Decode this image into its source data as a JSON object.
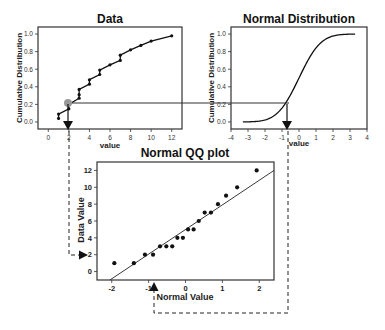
{
  "panels": {
    "data": {
      "title": "Data",
      "xlabel": "value",
      "ylabel": "Cumulative Distribution",
      "xticks": [
        "0",
        "2",
        "4",
        "6",
        "8",
        "10",
        "12"
      ],
      "yticks": [
        "0.0",
        "0.2",
        "0.4",
        "0.6",
        "0.8",
        "1.0"
      ]
    },
    "normal": {
      "title": "Normal Distribution",
      "xlabel": "value",
      "ylabel": "Cumulative Distribution",
      "xticks": [
        "-4",
        "-3",
        "-2",
        "-1",
        "0",
        "1",
        "2",
        "3",
        "4"
      ],
      "yticks": [
        "0.0",
        "0.2",
        "0.4",
        "0.6",
        "0.8",
        "1.0"
      ]
    },
    "qq": {
      "title": "Normal QQ plot",
      "xlabel": "Normal Value",
      "ylabel": "Data Value",
      "xticks": [
        "-2",
        "-1",
        "0",
        "1",
        "2"
      ],
      "yticks": [
        "0",
        "2",
        "4",
        "6",
        "8",
        "10",
        "12"
      ]
    }
  },
  "chart_data": [
    {
      "type": "line",
      "title": "Data",
      "xlabel": "value",
      "ylabel": "Cumulative Distribution",
      "xlim": [
        -1,
        13
      ],
      "ylim": [
        -0.08,
        1.08
      ],
      "description": "Empirical step CDF of the data",
      "x": [
        1,
        1,
        2,
        2,
        3,
        3,
        3,
        4,
        4,
        5,
        5,
        6,
        7,
        7,
        8,
        9,
        10,
        12
      ],
      "y": [
        0.04,
        0.09,
        0.15,
        0.2,
        0.27,
        0.31,
        0.37,
        0.43,
        0.48,
        0.54,
        0.59,
        0.65,
        0.7,
        0.76,
        0.82,
        0.87,
        0.92,
        0.98
      ],
      "highlight_point": {
        "x": 2,
        "y": 0.21
      }
    },
    {
      "type": "line",
      "title": "Normal Distribution",
      "xlabel": "value",
      "ylabel": "Cumulative Distribution",
      "xlim": [
        -4,
        4
      ],
      "ylim": [
        -0.08,
        1.08
      ],
      "description": "Standard normal CDF from -3.3 to 3.3",
      "highlight_point": {
        "x": -0.8,
        "y": 0.21
      }
    },
    {
      "type": "scatter",
      "title": "Normal QQ plot",
      "xlabel": "Normal Value",
      "ylabel": "Data Value",
      "xlim": [
        -2.4,
        2.4
      ],
      "ylim": [
        -1,
        13
      ],
      "x": [
        -1.93,
        -1.4,
        -1.1,
        -0.88,
        -0.69,
        -0.52,
        -0.36,
        -0.22,
        -0.07,
        0.07,
        0.22,
        0.36,
        0.52,
        0.69,
        0.88,
        1.1,
        1.4,
        1.93
      ],
      "y": [
        1,
        1,
        2,
        2,
        3,
        3,
        3,
        4,
        4,
        5,
        5,
        6,
        7,
        7,
        8,
        9,
        10,
        12
      ],
      "reference_line": {
        "x": [
          -2.05,
          2.4
        ],
        "y": [
          -1,
          12
        ]
      }
    }
  ]
}
